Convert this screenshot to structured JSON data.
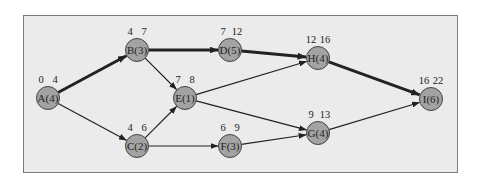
{
  "diagram": {
    "type": "activity-network-critical-path",
    "colors": {
      "background": "#ebebeb",
      "node_fill": "#a3a3a3",
      "node_stroke": "#444444",
      "edge": "#222222",
      "border": "#7a7a7a"
    },
    "nodes": [
      {
        "id": "A",
        "label": "A(4)",
        "early_start": "0",
        "early_finish": "4",
        "x": 48,
        "y": 98
      },
      {
        "id": "B",
        "label": "B(3)",
        "early_start": "4",
        "early_finish": "7",
        "x": 137,
        "y": 50
      },
      {
        "id": "C",
        "label": "C(2)",
        "early_start": "4",
        "early_finish": "6",
        "x": 137,
        "y": 146
      },
      {
        "id": "D",
        "label": "D(5)",
        "early_start": "7",
        "early_finish": "12",
        "x": 230,
        "y": 50
      },
      {
        "id": "E",
        "label": "E(1)",
        "early_start": "7",
        "early_finish": "8",
        "x": 185,
        "y": 98
      },
      {
        "id": "F",
        "label": "F(3)",
        "early_start": "6",
        "early_finish": "9",
        "x": 230,
        "y": 146
      },
      {
        "id": "G",
        "label": "G(4)",
        "early_start": "9",
        "early_finish": "13",
        "x": 318,
        "y": 133
      },
      {
        "id": "H",
        "label": "H(4)",
        "early_start": "12",
        "early_finish": "16",
        "x": 318,
        "y": 58
      },
      {
        "id": "I",
        "label": "I(6)",
        "early_start": "16",
        "early_finish": "22",
        "x": 431,
        "y": 99
      }
    ],
    "edges": [
      {
        "from": "A",
        "to": "B",
        "critical": true
      },
      {
        "from": "A",
        "to": "C",
        "critical": false
      },
      {
        "from": "B",
        "to": "D",
        "critical": true
      },
      {
        "from": "B",
        "to": "E",
        "critical": false
      },
      {
        "from": "C",
        "to": "E",
        "critical": false
      },
      {
        "from": "C",
        "to": "F",
        "critical": false
      },
      {
        "from": "D",
        "to": "H",
        "critical": true
      },
      {
        "from": "E",
        "to": "H",
        "critical": false
      },
      {
        "from": "E",
        "to": "G",
        "critical": false
      },
      {
        "from": "F",
        "to": "G",
        "critical": false
      },
      {
        "from": "H",
        "to": "I",
        "critical": true
      },
      {
        "from": "G",
        "to": "I",
        "critical": false
      }
    ]
  }
}
